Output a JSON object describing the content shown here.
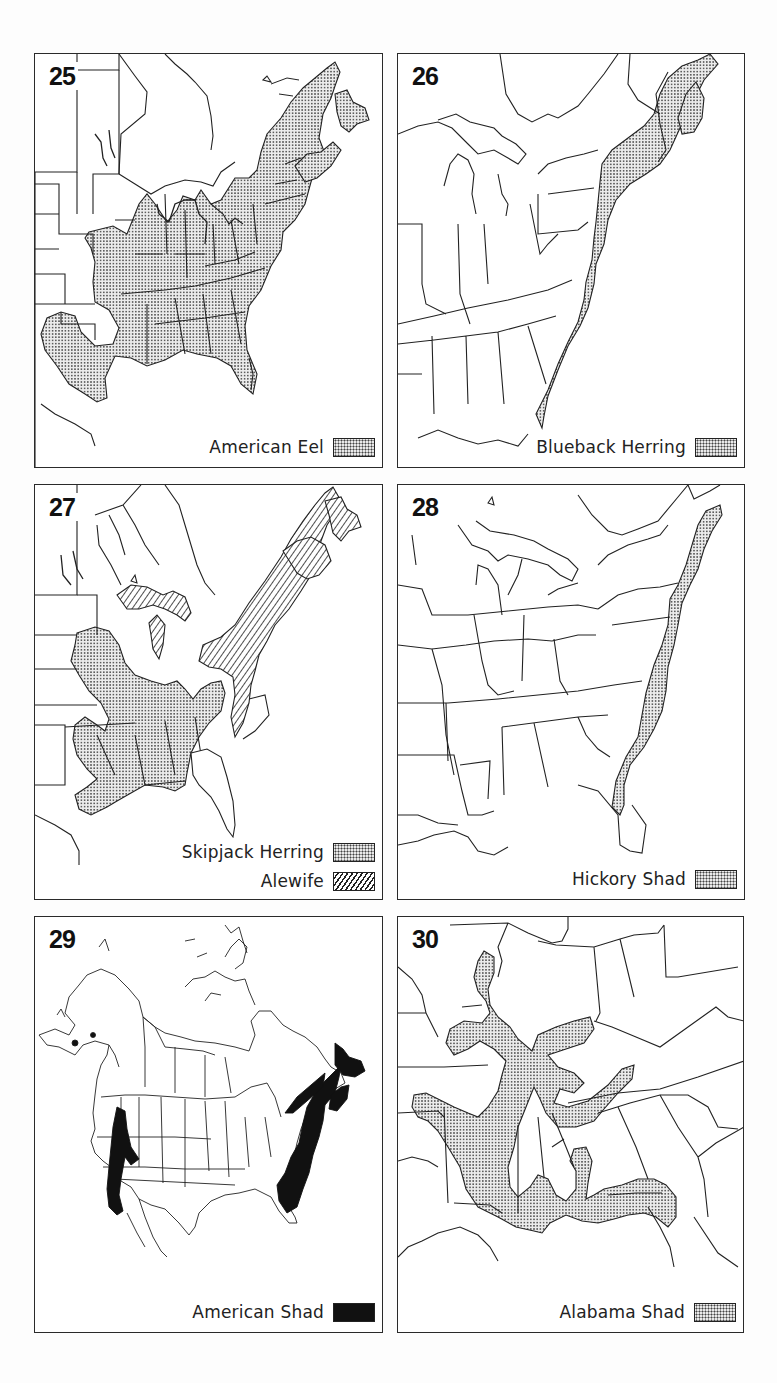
{
  "maps": [
    {
      "number": "25",
      "region": "Eastern North America",
      "legend": [
        {
          "label": "American Eel",
          "pattern": "stipple"
        }
      ]
    },
    {
      "number": "26",
      "region": "Eastern United States and Maritime Canada",
      "legend": [
        {
          "label": "Blueback Herring",
          "pattern": "stipple"
        }
      ]
    },
    {
      "number": "27",
      "region": "Eastern North America",
      "legend": [
        {
          "label": "Skipjack Herring",
          "pattern": "stipple"
        },
        {
          "label": "Alewife",
          "pattern": "hatch"
        }
      ]
    },
    {
      "number": "28",
      "region": "Eastern United States",
      "legend": [
        {
          "label": "Hickory Shad",
          "pattern": "stipple"
        }
      ]
    },
    {
      "number": "29",
      "region": "North America",
      "legend": [
        {
          "label": "American Shad",
          "pattern": "solid"
        }
      ]
    },
    {
      "number": "30",
      "region": "Southeastern United States",
      "legend": [
        {
          "label": "Alabama Shad",
          "pattern": "stipple"
        }
      ]
    }
  ],
  "colors": {
    "line": "#222222",
    "stipple_bg": "#e9e9e9",
    "stipple_dot": "#444444",
    "solid": "#111111",
    "paper": "#ffffff"
  }
}
